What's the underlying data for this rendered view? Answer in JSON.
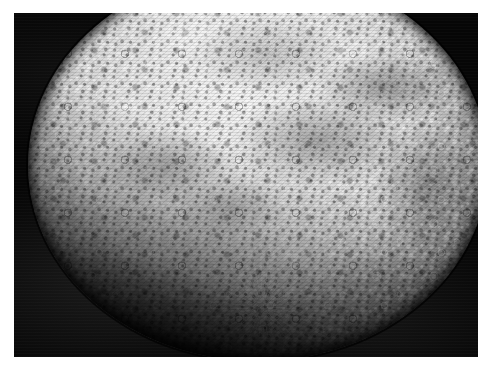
{
  "page": {
    "background_color": "#ffffff",
    "width": 495,
    "height": 376
  },
  "photo": {
    "subject": "planet-mercury",
    "caption": "",
    "alt_text": "Photomosaic of the heavily cratered planet Mercury against black space",
    "frame": {
      "left": 14,
      "top": 13,
      "width": 464,
      "height": 344,
      "space_color": "#050505",
      "border_color": "#ffffff"
    },
    "planet": {
      "name": "planet-disk",
      "surface_description": "densely cratered light-grey terrain with bright ray systems",
      "highlight_color": "#f2f2f2",
      "midtone_color": "#b2b2b2",
      "shadow_color": "#1a1a1a",
      "limb_shadow_color": "#000000",
      "features": [
        {
          "name": "rayed-crater-lower-center",
          "kind": "ray-system"
        },
        {
          "name": "rayed-crater-upper-right",
          "kind": "ray-system"
        },
        {
          "name": "dark-basin-right-of-center",
          "kind": "albedo-dark"
        },
        {
          "name": "bright-basin-upper-left",
          "kind": "albedo-bright"
        },
        {
          "name": "terminator-lower-left",
          "kind": "shadow"
        }
      ]
    }
  }
}
